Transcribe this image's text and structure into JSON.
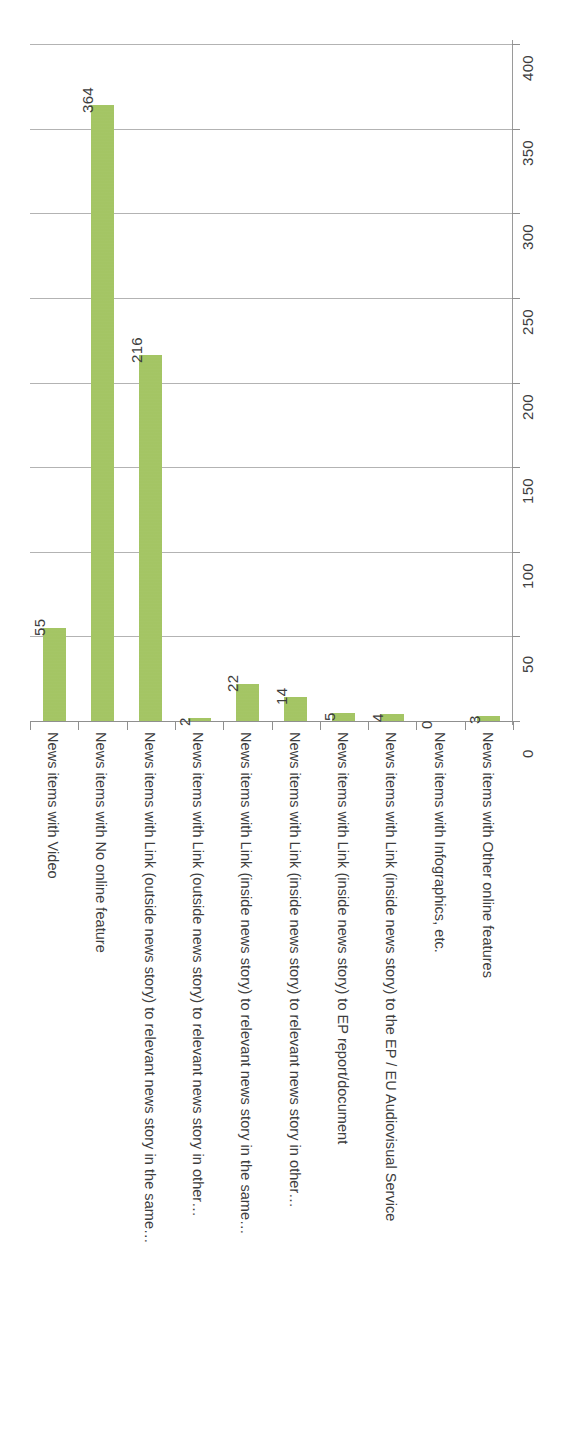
{
  "chart_data": {
    "type": "bar",
    "title": "",
    "subtitle": "",
    "xlabel": "",
    "ylabel": "",
    "orientation": "vertical-bars-rotated-page",
    "grid": true,
    "legend": "none",
    "ylim": [
      0,
      400
    ],
    "ytick_step": 50,
    "yticks": [
      "0",
      "50",
      "100",
      "150",
      "200",
      "250",
      "300",
      "350",
      "400"
    ],
    "bar_color": "#9fc25c",
    "gridline_color": "#a6a6a6",
    "axis_color": "#8f8f8f",
    "categories": [
      "News items with Video",
      "News items with No online feature",
      "News items with Link (outside news story) to relevant news story in the same…",
      "News items with Link (outside news story) to relevant news story in other…",
      "News items with Link (inside news story) to relevant news story in the same…",
      "News items with Link (inside news story) to relevant news story in other…",
      "News items with Link (inside news story) to EP report/document",
      "News items with Link (inside news story) to the EP / EU Audiovisual Service",
      "News items with Infographics, etc.",
      "News items with Other online features"
    ],
    "values": [
      55,
      364,
      216,
      2,
      22,
      14,
      5,
      4,
      0,
      3
    ],
    "value_labels": [
      "55",
      "364",
      "216",
      "2",
      "22",
      "14",
      "5",
      "4",
      "0",
      "3"
    ]
  }
}
